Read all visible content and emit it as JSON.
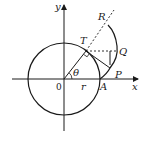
{
  "diagram": {
    "type": "geometry",
    "colors": {
      "stroke": "#1a1a1a",
      "background": "#ffffff"
    },
    "labels": {
      "y_axis": "y",
      "x_axis": "x",
      "origin": "0",
      "radius": "r",
      "angle": "θ",
      "point_A": "A",
      "point_P": "P",
      "point_Q": "Q",
      "point_T": "T",
      "point_R": "R"
    }
  }
}
